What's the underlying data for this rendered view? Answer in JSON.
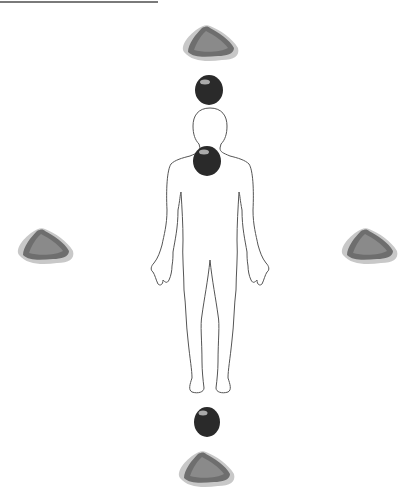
{
  "figure": {
    "top_rule": true,
    "colors": {
      "outline": "#555555",
      "flat_stone_fill": "#6e6e6e",
      "flat_stone_halo": "#bdbdbd",
      "round_stone_fill": "#2a2a2a"
    },
    "stones": [
      {
        "id": "top-flat",
        "kind": "flat",
        "x": 210,
        "y": 42
      },
      {
        "id": "above-head-round",
        "kind": "round",
        "x": 209,
        "y": 90
      },
      {
        "id": "neck-round",
        "kind": "round",
        "x": 207,
        "y": 160
      },
      {
        "id": "left-flat",
        "kind": "flat",
        "x": 45,
        "y": 245
      },
      {
        "id": "right-flat",
        "kind": "flat",
        "x": 367,
        "y": 245
      },
      {
        "id": "below-feet-round",
        "kind": "round",
        "x": 207,
        "y": 422
      },
      {
        "id": "bottom-flat",
        "kind": "flat",
        "x": 206,
        "y": 467
      }
    ]
  }
}
